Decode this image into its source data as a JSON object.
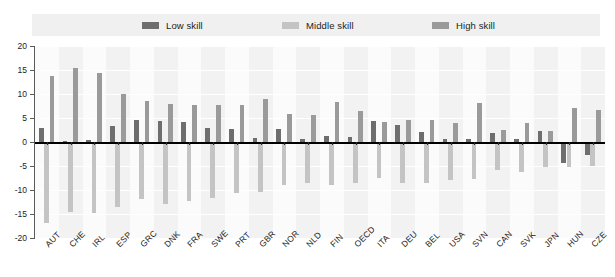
{
  "chart_data": {
    "type": "bar",
    "title": "",
    "subtitle": "",
    "xlabel": "",
    "ylabel": "",
    "ylim": [
      -20,
      20
    ],
    "ytick_step": 5,
    "yticks": [
      20,
      15,
      10,
      5,
      0,
      -5,
      -10,
      -15,
      -20
    ],
    "ytick_labels": [
      "20",
      "15",
      "10",
      "5",
      "0",
      "-5",
      "-10",
      "-15",
      "-20"
    ],
    "grid": true,
    "legend_position": "top",
    "categories": [
      "AUT",
      "CHE",
      "IRL",
      "ESP",
      "GRC",
      "DNK",
      "FRA",
      "SWE",
      "PRT",
      "GBR",
      "NOR",
      "NLD",
      "FIN",
      "OECD",
      "ITA",
      "DEU",
      "BEL",
      "USA",
      "SVN",
      "CAN",
      "SVK",
      "JPN",
      "HUN",
      "CZE"
    ],
    "series": [
      {
        "name": "Low skill",
        "color": "#6e6e6e",
        "values": [
          3.0,
          0.2,
          0.4,
          3.3,
          4.5,
          4.4,
          4.1,
          2.9,
          2.7,
          0.8,
          2.8,
          0.7,
          1.2,
          1.0,
          4.3,
          3.6,
          2.0,
          0.7,
          0.6,
          1.9,
          0.6,
          2.2,
          -4.4,
          -2.8
        ]
      },
      {
        "name": "Middle skill",
        "color": "#c4c4c4",
        "values": [
          -16.8,
          -14.6,
          -14.7,
          -13.6,
          -11.8,
          -12.9,
          -12.2,
          -11.6,
          -10.6,
          -10.5,
          -8.9,
          -8.5,
          -8.9,
          -8.5,
          -7.6,
          -8.6,
          -8.5,
          -7.9,
          -7.8,
          -5.8,
          -6.2,
          -5.3,
          -5.3,
          -5.0
        ]
      },
      {
        "name": "High skill",
        "color": "#9a9a9a",
        "values": [
          13.7,
          15.4,
          14.3,
          10.1,
          8.5,
          8.0,
          7.8,
          7.8,
          7.8,
          8.9,
          5.8,
          5.6,
          8.3,
          6.4,
          4.2,
          4.6,
          4.5,
          4.0,
          8.2,
          2.5,
          3.9,
          2.3,
          7.0,
          6.7
        ]
      }
    ]
  },
  "legend": {
    "items": [
      {
        "label": "Low skill"
      },
      {
        "label": "Middle skill"
      },
      {
        "label": "High skill"
      }
    ]
  }
}
